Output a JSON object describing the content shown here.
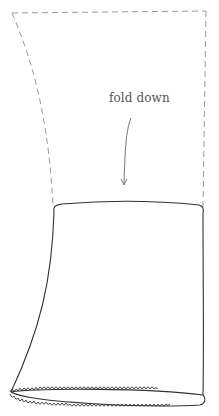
{
  "diagram": {
    "type": "sewing-instruction",
    "annotation": {
      "label": "fold down",
      "arrow_direction": "down"
    },
    "parts": [
      {
        "name": "fold-area",
        "style": "dashed-outline",
        "description": "portion to be folded down"
      },
      {
        "name": "sleeve-tube",
        "style": "solid-outline",
        "description": "fabric tube"
      },
      {
        "name": "serged-hem",
        "style": "overlock-stitch",
        "description": "serged bottom edge"
      }
    ],
    "colors": {
      "dashed_line": "#9a9a9a",
      "solid_line": "#333333",
      "label_text": "#555555",
      "arrow": "#777777"
    }
  }
}
